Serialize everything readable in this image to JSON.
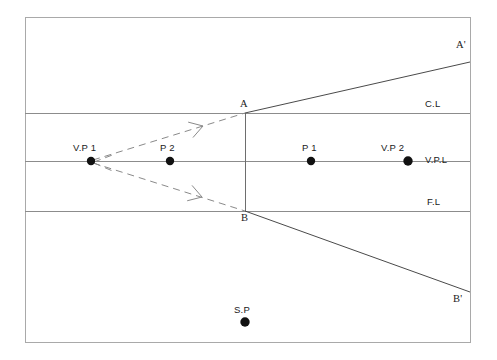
{
  "diagram": {
    "background_color": "#ffffff",
    "frame": {
      "x": 25,
      "y": 17,
      "width": 445,
      "height": 325,
      "stroke_color": "#a9a9a9"
    },
    "horizontal_lines": [
      {
        "name": "center-line",
        "label": "C.L",
        "y": 113,
        "x_start": 25,
        "x_end": 470,
        "label_x": 425,
        "label_y": 99,
        "stroke_color": "#8c8c8c"
      },
      {
        "name": "vanishing-point-line",
        "label": "V.P.L",
        "y": 161,
        "x_start": 25,
        "x_end": 470,
        "label_x": 425,
        "label_y": 155,
        "stroke_color": "#8c8c8c"
      },
      {
        "name": "foot-line",
        "label": "F.L",
        "y": 211,
        "x_start": 25,
        "x_end": 470,
        "label_x": 427,
        "label_y": 197,
        "stroke_color": "#8c8c8c"
      }
    ],
    "vertical_edge": {
      "name": "picture-plane-edge-AB",
      "x": 245,
      "y_top": 113,
      "y_bottom": 211,
      "stroke_color": "#6e6e6e"
    },
    "rays": [
      {
        "name": "ray-A-to-Aprime",
        "from": "A",
        "to": "A'",
        "x1": 245,
        "y1": 113,
        "x2": 470,
        "y2": 62,
        "style": "solid",
        "stroke_color": "#4a4a4a"
      },
      {
        "name": "ray-B-to-Bprime",
        "from": "B",
        "to": "B'",
        "x1": 245,
        "y1": 211,
        "x2": 470,
        "y2": 292,
        "style": "solid",
        "stroke_color": "#4a4a4a"
      },
      {
        "name": "dashed-ray-VP1-to-A",
        "from": "V.P 1",
        "to": "A",
        "x1": 93,
        "y1": 160,
        "x2": 245,
        "y2": 113,
        "style": "dashed",
        "arrow_at": {
          "x": 203,
          "y": 126
        },
        "stroke_color": "#8a8a8a"
      },
      {
        "name": "dashed-ray-VP1-to-B",
        "from": "V.P 1",
        "to": "B",
        "x1": 93,
        "y1": 163,
        "x2": 245,
        "y2": 211,
        "style": "dashed",
        "arrow_at": {
          "x": 202,
          "y": 197
        },
        "stroke_color": "#8a8a8a"
      }
    ],
    "points": [
      {
        "name": "point-vp1",
        "label": "V.P 1",
        "x": 91,
        "y": 161,
        "radius": 4.2,
        "label_x": 73,
        "label_y": 143,
        "color": "#111111"
      },
      {
        "name": "point-p2",
        "label": "P 2",
        "x": 170,
        "y": 161,
        "radius": 4.2,
        "label_x": 160,
        "label_y": 143,
        "color": "#111111"
      },
      {
        "name": "point-p1",
        "label": "P 1",
        "x": 311,
        "y": 161,
        "radius": 4.2,
        "label_x": 302,
        "label_y": 143,
        "color": "#111111"
      },
      {
        "name": "point-vp2",
        "label": "V.P 2",
        "x": 408,
        "y": 161,
        "radius": 4.7,
        "label_x": 381,
        "label_y": 143,
        "color": "#111111"
      },
      {
        "name": "point-sp",
        "label": "S.P",
        "x": 245,
        "y": 322,
        "radius": 4.7,
        "label_x": 234,
        "label_y": 305,
        "color": "#111111"
      }
    ],
    "vertex_labels": [
      {
        "name": "vertex-label-A",
        "label": "A",
        "x": 240,
        "y": 99
      },
      {
        "name": "vertex-label-B",
        "label": "B",
        "x": 241,
        "y": 213
      },
      {
        "name": "vertex-label-A-prime",
        "label": "A'",
        "x": 456,
        "y": 40
      },
      {
        "name": "vertex-label-B-prime",
        "label": "B'",
        "x": 453,
        "y": 294
      }
    ]
  }
}
